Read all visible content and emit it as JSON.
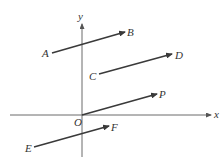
{
  "diagram": {
    "type": "vectors-on-coordinate-plane",
    "colors": {
      "axis": "#6a6a6a",
      "vector": "#3a3a3a",
      "label": "#333333",
      "background": "#ffffff"
    },
    "axes": {
      "x_label": "x",
      "y_label": "y",
      "origin_label": "O"
    },
    "vectors": [
      {
        "id": "AB",
        "tail_label": "A",
        "head_label": "B",
        "tail": [
          52,
          53
        ],
        "head": [
          125,
          32
        ]
      },
      {
        "id": "CD",
        "tail_label": "C",
        "head_label": "D",
        "tail": [
          99,
          74
        ],
        "head": [
          172,
          54
        ]
      },
      {
        "id": "OP",
        "tail_label": "O",
        "head_label": "P",
        "tail": [
          82,
          115
        ],
        "head": [
          157,
          94
        ]
      },
      {
        "id": "EF",
        "tail_label": "E",
        "head_label": "F",
        "tail": [
          34,
          147
        ],
        "head": [
          109,
          126
        ]
      }
    ]
  }
}
